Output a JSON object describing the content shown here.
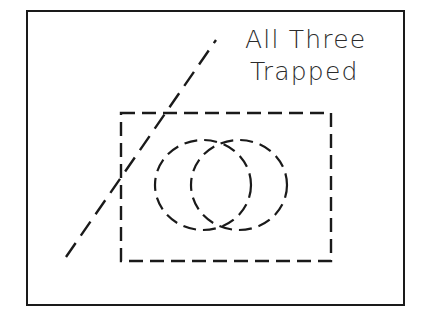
{
  "figure": {
    "background_color": "#ffffff",
    "stroke_color": "#1a1a1a",
    "label": {
      "line1": "All Three",
      "line2": "Trapped",
      "font_size_px": 25,
      "color": "#2b2b2b",
      "x": 245,
      "y_line1": 48,
      "y_line2": 80
    },
    "outer_border": {
      "name": "outer-frame",
      "x": 26,
      "y": 10,
      "width": 378,
      "height": 295,
      "stroke_width": 2,
      "style": "solid"
    },
    "dashed_rectangle": {
      "name": "trap-region-rectangle",
      "x": 121,
      "y": 113,
      "width": 210,
      "height": 148,
      "stroke_width": 2.4,
      "style": "dashed",
      "dash_pattern": "14 7"
    },
    "ellipses": [
      {
        "name": "left-ellipse",
        "cx": 203,
        "cy": 185,
        "rx": 48,
        "ry": 45,
        "stroke_width": 2.2,
        "style": "dashed",
        "dash_pattern": "13 7"
      },
      {
        "name": "right-ellipse",
        "cx": 239,
        "cy": 185,
        "rx": 48,
        "ry": 45,
        "stroke_width": 2.2,
        "style": "dashed",
        "dash_pattern": "13 7"
      }
    ],
    "diagonal_line": {
      "name": "separatrix-line",
      "x1": 66,
      "y1": 257,
      "x2": 216,
      "y2": 40,
      "stroke_width": 2.4,
      "style": "dashed",
      "dash_pattern": "17 9"
    }
  }
}
